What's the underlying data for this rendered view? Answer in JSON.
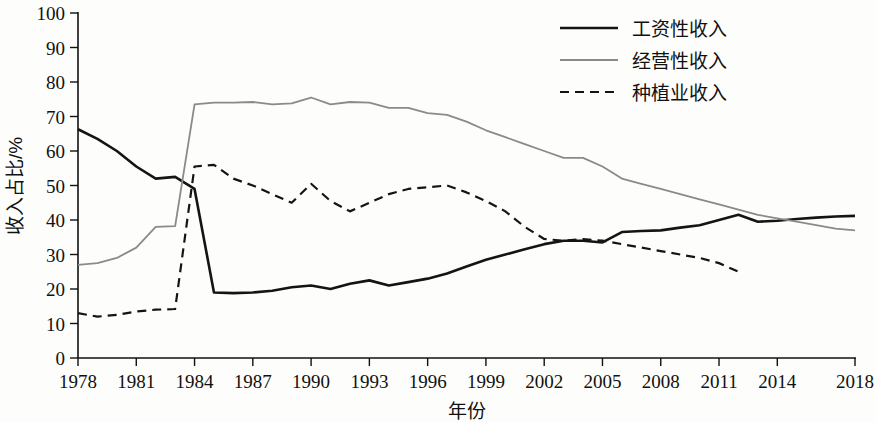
{
  "chart_data": {
    "type": "line",
    "title": "",
    "xlabel": "年份",
    "ylabel": "收入占比/%",
    "xlim": [
      1978,
      2018
    ],
    "ylim": [
      0,
      100
    ],
    "grid": false,
    "legend_position": "top-right",
    "y_ticks": [
      0,
      10,
      20,
      30,
      40,
      50,
      60,
      70,
      80,
      90,
      100
    ],
    "y_tick_labels": [
      "0",
      "10",
      "20",
      "30",
      "40",
      "50",
      "60",
      "70",
      "80",
      "90",
      "100"
    ],
    "x_ticks": [
      1978,
      1981,
      1984,
      1987,
      1990,
      1993,
      1996,
      1999,
      2002,
      2005,
      2008,
      2011,
      2014,
      2018
    ],
    "x_tick_labels": [
      "1978",
      "1981",
      "1984",
      "1987",
      "1990",
      "1993",
      "1996",
      "1999",
      "2002",
      "2005",
      "2008",
      "2011",
      "2014",
      "2018"
    ],
    "x": [
      1978,
      1979,
      1980,
      1981,
      1982,
      1983,
      1984,
      1985,
      1986,
      1987,
      1988,
      1989,
      1990,
      1991,
      1992,
      1993,
      1994,
      1995,
      1996,
      1997,
      1998,
      1999,
      2000,
      2001,
      2002,
      2003,
      2004,
      2005,
      2006,
      2007,
      2008,
      2009,
      2010,
      2011,
      2012,
      2013,
      2014,
      2015,
      2016,
      2017,
      2018
    ],
    "series": [
      {
        "name": "工资性收入",
        "style": "solid",
        "color": "#141414",
        "width": 2.6,
        "values": [
          66.3,
          63.5,
          60.0,
          55.5,
          52.0,
          52.5,
          49.0,
          19.0,
          18.8,
          19.0,
          19.5,
          20.5,
          21.0,
          20.0,
          21.5,
          22.5,
          21.0,
          22.0,
          23.0,
          24.5,
          26.5,
          28.5,
          30.0,
          31.5,
          33.0,
          34.0,
          34.0,
          33.5,
          36.5,
          36.8,
          37.0,
          37.8,
          38.5,
          40.0,
          41.5,
          39.5,
          39.8,
          40.3,
          40.7,
          41.0,
          41.2
        ]
      },
      {
        "name": "经营性收入",
        "style": "solid",
        "color": "#8a8a8a",
        "width": 1.8,
        "values": [
          27.0,
          27.5,
          29.0,
          32.0,
          38.0,
          38.2,
          73.5,
          74.0,
          74.0,
          74.2,
          73.5,
          73.8,
          75.5,
          73.5,
          74.2,
          74.0,
          72.5,
          72.5,
          71.0,
          70.5,
          68.5,
          66.0,
          64.0,
          62.0,
          60.0,
          58.0,
          58.0,
          55.5,
          52.0,
          50.5,
          49.0,
          47.5,
          46.0,
          44.5,
          43.0,
          41.5,
          40.5,
          39.5,
          38.5,
          37.5,
          37.0
        ]
      },
      {
        "name": "种植业收入",
        "style": "dashed",
        "color": "#141414",
        "width": 2.2,
        "values": [
          13.0,
          12.0,
          12.5,
          13.5,
          14.0,
          14.2,
          55.5,
          56.0,
          52.0,
          50.0,
          47.5,
          45.0,
          50.5,
          45.5,
          42.5,
          45.0,
          47.5,
          49.0,
          49.5,
          50.0,
          48.0,
          45.5,
          42.5,
          38.0,
          34.5,
          34.0,
          34.5,
          34.0,
          33.0,
          32.0,
          31.0,
          30.0,
          29.0,
          27.5,
          25.0,
          null,
          null,
          null,
          null,
          null,
          null
        ]
      }
    ]
  },
  "legend": {
    "entries": [
      {
        "label": "工资性收入"
      },
      {
        "label": "经营性收入"
      },
      {
        "label": "种植业收入"
      }
    ]
  }
}
